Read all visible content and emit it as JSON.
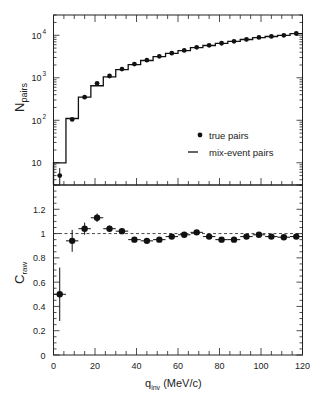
{
  "chart_data": [
    {
      "type": "line",
      "panel": "upper",
      "title": "",
      "xlabel": "",
      "ylabel": "N_pairs",
      "ylabel_main": "N",
      "ylabel_sub": "pairs",
      "yscale": "log",
      "xlim": [
        0,
        120
      ],
      "ylim": [
        3,
        30000
      ],
      "ytick_labels": [
        {
          "value": 10,
          "base": "10",
          "exp": ""
        },
        {
          "value": 100,
          "base": "10",
          "exp": "2"
        },
        {
          "value": 1000,
          "base": "10",
          "exp": "3"
        },
        {
          "value": 10000,
          "base": "10",
          "exp": "4"
        }
      ],
      "legend": {
        "position": "lower right",
        "entries": [
          {
            "label": "true pairs",
            "marker": "dot"
          },
          {
            "label": "mix-event pairs",
            "marker": "line"
          }
        ]
      },
      "bin_width": 6,
      "x": [
        3,
        9,
        15,
        21,
        27,
        33,
        39,
        45,
        51,
        57,
        63,
        69,
        75,
        81,
        87,
        93,
        99,
        105,
        111,
        117
      ],
      "series": [
        {
          "name": "true pairs",
          "style": "points",
          "values": [
            5,
            105,
            350,
            740,
            1100,
            1600,
            2100,
            2600,
            3200,
            3800,
            4400,
            5200,
            5800,
            6500,
            7200,
            8000,
            8900,
            9400,
            10000,
            11000
          ],
          "yerr_low": [
            2,
            0,
            0,
            0,
            0,
            0,
            0,
            0,
            0,
            0,
            0,
            0,
            0,
            0,
            0,
            0,
            0,
            0,
            0,
            0
          ],
          "yerr_high": [
            2.5,
            0,
            0,
            0,
            0,
            0,
            0,
            0,
            0,
            0,
            0,
            0,
            0,
            0,
            0,
            0,
            0,
            0,
            0,
            0
          ]
        },
        {
          "name": "mix-event pairs",
          "style": "step-histogram",
          "values": [
            10,
            110,
            350,
            650,
            1050,
            1550,
            2050,
            2550,
            3150,
            3750,
            4350,
            5100,
            5750,
            6450,
            7150,
            7950,
            8800,
            9350,
            9950,
            10900
          ]
        }
      ]
    },
    {
      "type": "scatter",
      "panel": "lower",
      "title": "",
      "xlabel": "q_inv (MeV/c)",
      "xlabel_main": "q",
      "xlabel_sub": "inv",
      "xlabel_unit": " (MeV/c)",
      "ylabel": "C_raw",
      "ylabel_main": "C",
      "ylabel_sub": "raw",
      "xlim": [
        0,
        120
      ],
      "ylim": [
        0,
        1.4
      ],
      "xticks": [
        0,
        20,
        40,
        60,
        80,
        100,
        120
      ],
      "xtick_labels": [
        "0",
        "20",
        "40",
        "60",
        "80",
        "100",
        "120"
      ],
      "yticks": [
        0,
        0.2,
        0.4,
        0.6,
        0.8,
        1,
        1.2
      ],
      "ytick_labels": [
        "0",
        "0.2",
        "0.4",
        "0.6",
        "0.8",
        "1",
        "1.2"
      ],
      "reference_line": {
        "y": 1,
        "style": "dashed"
      },
      "x": [
        3,
        9,
        15,
        21,
        27,
        33,
        39,
        45,
        51,
        57,
        63,
        69,
        75,
        81,
        87,
        93,
        99,
        105,
        111,
        117
      ],
      "series": [
        {
          "name": "C_raw",
          "values": [
            0.5,
            0.94,
            1.04,
            1.13,
            1.04,
            1.02,
            0.95,
            0.94,
            0.95,
            0.975,
            0.99,
            1.01,
            0.975,
            0.95,
            0.95,
            0.975,
            0.99,
            0.975,
            0.97,
            0.975
          ],
          "yerr": [
            0.22,
            0.09,
            0.05,
            0.035,
            0.025,
            0.02,
            0.015,
            0.015,
            0.012,
            0.012,
            0.01,
            0.01,
            0.01,
            0.01,
            0.01,
            0.01,
            0.01,
            0.01,
            0.01,
            0.01
          ],
          "xerr": 3
        }
      ]
    }
  ]
}
